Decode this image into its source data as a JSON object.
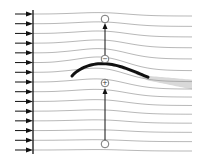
{
  "diagram": {
    "title": "Streamlines around a cambered airfoil",
    "inflow": {
      "arrow_count": 15,
      "direction": "right"
    },
    "streamline_count": 15,
    "pressure_markers": [
      {
        "id": "upper",
        "symbol": "−",
        "meaning": "low pressure"
      },
      {
        "id": "lower",
        "symbol": "+",
        "meaning": "high pressure"
      }
    ],
    "colors": {
      "streamline": "#9a9a9a",
      "airfoil": "#111111",
      "wake": "#d9d9d9",
      "arrow": "#111111",
      "marker": "#555555"
    }
  }
}
